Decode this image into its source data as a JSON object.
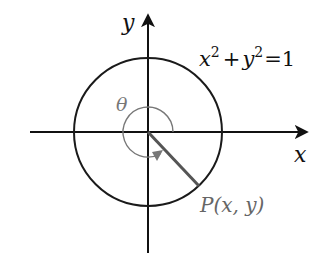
{
  "diagram": {
    "colors": {
      "axis": "#111111",
      "circle": "#1a1a1a",
      "radius": "#555555",
      "angle_arc": "#777777",
      "label": "#111111",
      "point_label": "#666666"
    },
    "axes": {
      "x_label": "x",
      "y_label": "y"
    },
    "equation": {
      "lhs_x": "x",
      "exp_x": "2",
      "plus": "+",
      "lhs_y": "y",
      "exp_y": "2",
      "equals": "=",
      "rhs": "1"
    },
    "angle_label": "θ",
    "point_label": "P(x, y)"
  }
}
